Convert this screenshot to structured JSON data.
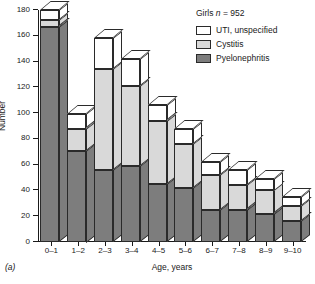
{
  "panel_label": "(a)",
  "legend": {
    "title_prefix": "Girls ",
    "title_n": "n",
    "title_value": " = 952",
    "title_full": "Girls n = 952",
    "items": [
      {
        "label": "UTI, unspecified",
        "color": "#ffffff",
        "key": "uti_unspecified"
      },
      {
        "label": "Cystitis",
        "color": "#d9d9d9",
        "key": "cystitis"
      },
      {
        "label": "Pyelonephritis",
        "color": "#7d7d7d",
        "key": "pyelonephritis"
      }
    ]
  },
  "chart_data": {
    "type": "bar",
    "subtype": "stacked-3d-column",
    "title": "",
    "xlabel": "Age, years",
    "ylabel": "Number",
    "ylim": [
      0,
      180
    ],
    "yticks": [
      0,
      20,
      40,
      60,
      80,
      100,
      120,
      140,
      160,
      180
    ],
    "grid": false,
    "legend_position": "top-right",
    "categories": [
      "0–1",
      "1–2",
      "2–3",
      "3–4",
      "4–5",
      "5–6",
      "6–7",
      "7–8",
      "8–9",
      "9–10"
    ],
    "series": [
      {
        "name": "Pyelonephritis",
        "color": "#7d7d7d",
        "values": [
          167,
          71,
          56,
          59,
          45,
          42,
          25,
          25,
          22,
          16
        ]
      },
      {
        "name": "Cystitis",
        "color": "#d9d9d9",
        "values": [
          5,
          17,
          78,
          62,
          49,
          34,
          27,
          19,
          18,
          12
        ]
      },
      {
        "name": "UTI, unspecified",
        "color": "#ffffff",
        "values": [
          8,
          11,
          24,
          21,
          12,
          12,
          10,
          12,
          9,
          7
        ]
      }
    ],
    "totals": [
      180,
      99,
      158,
      142,
      106,
      88,
      62,
      56,
      49,
      35
    ]
  }
}
